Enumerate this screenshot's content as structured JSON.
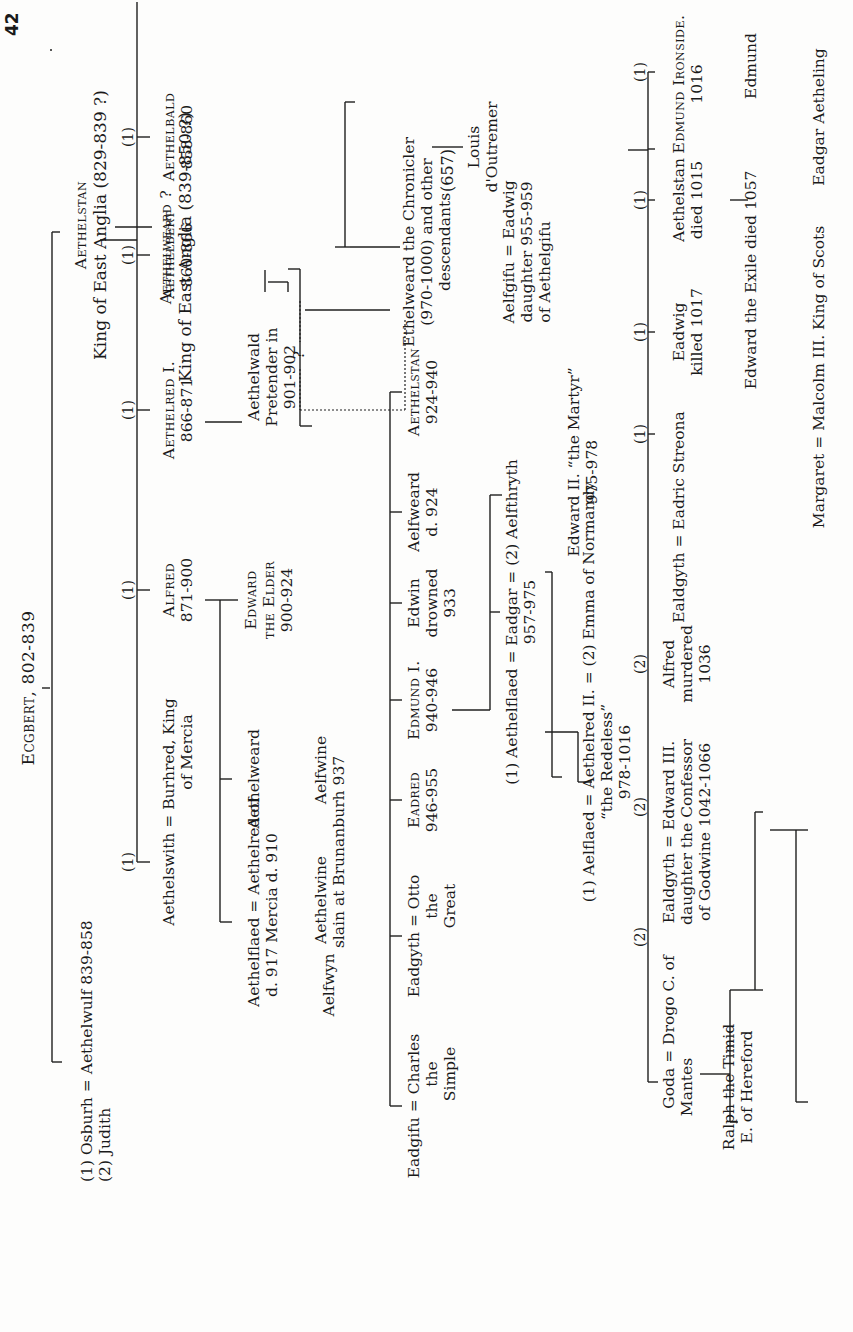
{
  "page": {
    "folio": "42",
    "page_number": "(657)"
  },
  "tree": {
    "root": {
      "name": "Ecgbert, 802-839"
    },
    "gen1": {
      "aethelwulf": {
        "line": "(1) Osburh = Aethelwulf 839-858",
        "second": "(2) Judith"
      },
      "aethelstan_ea": {
        "name": "Aethelstan",
        "detail": "King of East Anglia (829-839 ?)"
      }
    },
    "gen1b": {
      "aethelweard_ea": {
        "name": "Aethelweard ?",
        "detail": "King of East Anglia (839-850 ?)"
      }
    },
    "gen2": [
      {
        "mark": "(1)",
        "name": "Aethelbald",
        "dates": "858-860"
      },
      {
        "mark": "(1)",
        "name": "Aethelbert",
        "dates": "860-866"
      },
      {
        "mark": "(1)",
        "name": "Aethelred I.",
        "dates": "866-871"
      },
      {
        "mark": "(1)",
        "name": "Alfred",
        "dates": "871-900"
      },
      {
        "mark": "(1)",
        "name": "Aethelswith = Burhred, King",
        "dates": "of Mercia"
      }
    ],
    "aethelwald": {
      "l1": "Aethelwald",
      "l2": "Pretender in",
      "l3": "901-902",
      "q": "?"
    },
    "ethelweard_chronicler": {
      "l1": "Ethelweard the Chronicler",
      "l2": "(970-1000) and other",
      "l3": "descendants"
    },
    "alfred_children": {
      "edward_elder": {
        "l1": "Edward",
        "l2": "the Elder",
        "l3": "900-924"
      },
      "aethelweard": {
        "name": "Aethelweard"
      },
      "aethelflaed": {
        "l1": "Aethelflaed = Aethelred of",
        "l2": "d. 917        Mercia d. 910"
      },
      "aelfwyn": {
        "name": "Aelfwyn"
      }
    },
    "aethelweard_children": {
      "aelfwine": {
        "l1": "Aelfwine",
        "l2": "slain at Brunanburh 937"
      },
      "aethelwine": {
        "l1": "Aethelwine"
      }
    },
    "edward_children": [
      {
        "name": "Aethelstan",
        "dates": "924-940"
      },
      {
        "name": "Aelfweard",
        "dates": "d. 924"
      },
      {
        "name": "Edwin",
        "dates": "drowned",
        "extra": "933"
      },
      {
        "name": "Edmund I.",
        "dates": "940-946"
      },
      {
        "name": "Eadred",
        "dates": "946-955"
      },
      {
        "name": "Eadgyth = Otto",
        "dates": "the",
        "extra": "Great"
      },
      {
        "name": "Eadgifu = Charles",
        "dates": "the",
        "extra": "Simple"
      }
    ],
    "louis": {
      "l1": "Louis",
      "l2": "d'Outremer"
    },
    "edmund_children": {
      "eadwig": {
        "l1": "Aelfgifu = Eadwig",
        "l2": "daughter   955-959",
        "l3": "of Aethelgifu"
      },
      "eadgar": {
        "l1": "(1) Aethelflaed = Eadgar = (2) Aelfthryth",
        "l2": "957-975"
      }
    },
    "eadgar_children": {
      "edward_martyr": {
        "l1": "Edward II. “the Martyr”",
        "l2": "975-978"
      },
      "aethelred2": {
        "l1": "(1) Aelflaed = Aethelred II. = (2) Emma of Normandy",
        "l2": "“the Redeless”",
        "l3": "978-1016"
      }
    },
    "aethelred2_children": [
      {
        "mark": "(1)",
        "l1": "Edmund Ironside.",
        "l2": "1016"
      },
      {
        "mark": "(1)",
        "l1": "Aethelstan",
        "l2": "died 1015"
      },
      {
        "mark": "(1)",
        "l1": "Eadwig",
        "l2": "killed 1017"
      },
      {
        "mark": "(1)",
        "l1": "Ealdgyth = Eadric Streona",
        "l2": ""
      },
      {
        "mark": "(2)",
        "l1": "Alfred",
        "l2": "murdered",
        "l3": "1036"
      },
      {
        "mark": "(2)",
        "l1": "Ealdgyth = Edward III.",
        "l2": "daughter   the Confessor",
        "l3": "of Godwine    1042-1066"
      },
      {
        "mark": "(2)",
        "l1": "Goda = Drogo C. of",
        "l2": "Mantes"
      }
    ],
    "ralph": {
      "l1": "Ralph the Timid",
      "l2": "E. of Hereford"
    },
    "ironside_children": {
      "edmund": {
        "name": "Edmund"
      },
      "edward_exile": {
        "name": "Edward the Exile died 1057"
      }
    },
    "exile_children": {
      "eadgar_aetheling": {
        "name": "Eadgar Aetheling"
      },
      "margaret": {
        "name": "Margaret = Malcolm III. King of Scots"
      }
    }
  }
}
